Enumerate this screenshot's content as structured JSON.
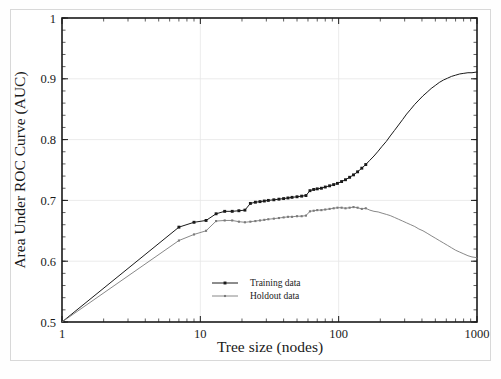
{
  "chart_data": {
    "type": "line",
    "title": "",
    "xlabel": "Tree size (nodes)",
    "ylabel": "Area Under ROC Curve (AUC)",
    "xscale": "log",
    "yscale": "linear",
    "xlim": [
      1,
      1000
    ],
    "ylim": [
      0.5,
      1.0
    ],
    "xticks": [
      1,
      10,
      100,
      1000
    ],
    "xtick_labels": [
      "1",
      "10",
      "100",
      "1000"
    ],
    "yticks": [
      0.5,
      0.6,
      0.7,
      0.8,
      0.9,
      1.0
    ],
    "ytick_labels": [
      "0.5",
      "0.6",
      "0.7",
      "0.8",
      "0.9",
      "1"
    ],
    "grid": true,
    "grid_color": "#e6e6e6",
    "legend_position": "lower-center",
    "series": [
      {
        "name": "Training data",
        "color": "#1a1a1a",
        "marker": "filled-square",
        "linewidth": 1.0,
        "points": [
          [
            1,
            0.5
          ],
          [
            7,
            0.656
          ],
          [
            9,
            0.664
          ],
          [
            11,
            0.667
          ],
          [
            13,
            0.678
          ],
          [
            15,
            0.682
          ],
          [
            17,
            0.682
          ],
          [
            19,
            0.683
          ],
          [
            21,
            0.684
          ],
          [
            23,
            0.695
          ],
          [
            25,
            0.697
          ],
          [
            27,
            0.698
          ],
          [
            29,
            0.699
          ],
          [
            31,
            0.7
          ],
          [
            34,
            0.701
          ],
          [
            37,
            0.702
          ],
          [
            40,
            0.703
          ],
          [
            43,
            0.704
          ],
          [
            46,
            0.705
          ],
          [
            50,
            0.706
          ],
          [
            54,
            0.707
          ],
          [
            58,
            0.708
          ],
          [
            62,
            0.716
          ],
          [
            66,
            0.718
          ],
          [
            70,
            0.719
          ],
          [
            75,
            0.72
          ],
          [
            80,
            0.722
          ],
          [
            86,
            0.724
          ],
          [
            92,
            0.726
          ],
          [
            98,
            0.728
          ],
          [
            105,
            0.731
          ],
          [
            112,
            0.734
          ],
          [
            120,
            0.738
          ],
          [
            128,
            0.742
          ],
          [
            137,
            0.747
          ],
          [
            147,
            0.753
          ],
          [
            157,
            0.759
          ],
          [
            168,
            0.766
          ],
          [
            180,
            0.773
          ],
          [
            193,
            0.781
          ],
          [
            206,
            0.789
          ],
          [
            221,
            0.797
          ],
          [
            236,
            0.806
          ],
          [
            253,
            0.815
          ],
          [
            271,
            0.824
          ],
          [
            290,
            0.833
          ],
          [
            310,
            0.842
          ],
          [
            332,
            0.85
          ],
          [
            355,
            0.858
          ],
          [
            380,
            0.865
          ],
          [
            407,
            0.872
          ],
          [
            436,
            0.878
          ],
          [
            466,
            0.884
          ],
          [
            499,
            0.889
          ],
          [
            534,
            0.894
          ],
          [
            572,
            0.898
          ],
          [
            612,
            0.901
          ],
          [
            655,
            0.904
          ],
          [
            701,
            0.906
          ],
          [
            750,
            0.908
          ],
          [
            803,
            0.909
          ],
          [
            860,
            0.91
          ],
          [
            920,
            0.91
          ],
          [
            985,
            0.911
          ],
          [
            1000,
            0.911
          ]
        ]
      },
      {
        "name": "Holdout data",
        "color": "#7a7a7a",
        "marker": "small-square",
        "linewidth": 0.9,
        "points": [
          [
            1,
            0.5
          ],
          [
            7,
            0.634
          ],
          [
            9,
            0.644
          ],
          [
            11,
            0.65
          ],
          [
            13,
            0.666
          ],
          [
            15,
            0.667
          ],
          [
            17,
            0.667
          ],
          [
            19,
            0.665
          ],
          [
            21,
            0.664
          ],
          [
            23,
            0.665
          ],
          [
            25,
            0.666
          ],
          [
            27,
            0.667
          ],
          [
            29,
            0.668
          ],
          [
            31,
            0.669
          ],
          [
            34,
            0.67
          ],
          [
            37,
            0.671
          ],
          [
            40,
            0.672
          ],
          [
            43,
            0.673
          ],
          [
            46,
            0.673
          ],
          [
            50,
            0.674
          ],
          [
            54,
            0.674
          ],
          [
            58,
            0.675
          ],
          [
            62,
            0.682
          ],
          [
            66,
            0.683
          ],
          [
            70,
            0.684
          ],
          [
            75,
            0.684
          ],
          [
            80,
            0.685
          ],
          [
            86,
            0.686
          ],
          [
            92,
            0.687
          ],
          [
            98,
            0.688
          ],
          [
            105,
            0.688
          ],
          [
            112,
            0.687
          ],
          [
            120,
            0.688
          ],
          [
            128,
            0.689
          ],
          [
            137,
            0.688
          ],
          [
            147,
            0.686
          ],
          [
            157,
            0.687
          ],
          [
            168,
            0.684
          ],
          [
            180,
            0.682
          ],
          [
            193,
            0.681
          ],
          [
            206,
            0.679
          ],
          [
            221,
            0.677
          ],
          [
            236,
            0.675
          ],
          [
            253,
            0.672
          ],
          [
            271,
            0.669
          ],
          [
            290,
            0.666
          ],
          [
            310,
            0.663
          ],
          [
            332,
            0.66
          ],
          [
            355,
            0.657
          ],
          [
            380,
            0.653
          ],
          [
            407,
            0.65
          ],
          [
            436,
            0.646
          ],
          [
            466,
            0.642
          ],
          [
            499,
            0.638
          ],
          [
            534,
            0.634
          ],
          [
            572,
            0.63
          ],
          [
            612,
            0.626
          ],
          [
            655,
            0.622
          ],
          [
            701,
            0.618
          ],
          [
            750,
            0.615
          ],
          [
            803,
            0.612
          ],
          [
            860,
            0.609
          ],
          [
            920,
            0.607
          ],
          [
            985,
            0.606
          ],
          [
            1000,
            0.605
          ]
        ]
      }
    ],
    "legend": [
      {
        "label": "Training data",
        "color": "#1a1a1a"
      },
      {
        "label": "Holdout data",
        "color": "#7a7a7a"
      }
    ]
  }
}
